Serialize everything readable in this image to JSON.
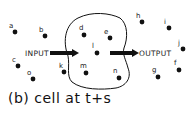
{
  "caption": "(b) cell at t+s",
  "input_label": "INPUT",
  "output_label": "OUTPUT",
  "points": [
    {
      "id": "a",
      "x": 15,
      "y": 32,
      "lx": 9,
      "ly": 28
    },
    {
      "id": "b",
      "x": 45,
      "y": 36,
      "lx": 39,
      "ly": 32
    },
    {
      "id": "c",
      "x": 18,
      "y": 66,
      "lx": 12,
      "ly": 62
    },
    {
      "id": "o",
      "x": 33,
      "y": 79,
      "lx": 27,
      "ly": 75
    },
    {
      "id": "d",
      "x": 84,
      "y": 35,
      "lx": 79,
      "ly": 30
    },
    {
      "id": "e",
      "x": 110,
      "y": 38,
      "lx": 104,
      "ly": 34
    },
    {
      "id": "l",
      "x": 97,
      "y": 53,
      "lx": 92,
      "ly": 48
    },
    {
      "id": "k",
      "x": 64,
      "y": 72,
      "lx": 59,
      "ly": 68
    },
    {
      "id": "m",
      "x": 86,
      "y": 73,
      "lx": 80,
      "ly": 68
    },
    {
      "id": "n",
      "x": 119,
      "y": 78,
      "lx": 113,
      "ly": 73
    },
    {
      "id": "h",
      "x": 142,
      "y": 22,
      "lx": 136,
      "ly": 18
    },
    {
      "id": "i",
      "x": 169,
      "y": 28,
      "lx": 164,
      "ly": 24
    },
    {
      "id": "j",
      "x": 183,
      "y": 49,
      "lx": 178,
      "ly": 45
    },
    {
      "id": "f",
      "x": 179,
      "y": 70,
      "lx": 174,
      "ly": 65
    },
    {
      "id": "g",
      "x": 158,
      "y": 77,
      "lx": 152,
      "ly": 72
    }
  ]
}
